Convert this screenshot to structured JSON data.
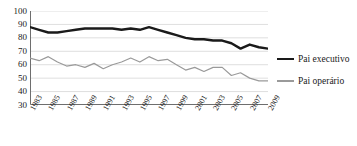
{
  "chart_data": {
    "type": "line",
    "title": "",
    "xlabel": "",
    "ylabel": "",
    "ylim": [
      30,
      100
    ],
    "ytick_values": [
      30,
      40,
      50,
      60,
      70,
      80,
      90,
      100
    ],
    "ytick_labels": [
      "30",
      "40",
      "50",
      "60",
      "70",
      "80",
      "90",
      "100"
    ],
    "grid": true,
    "grid_axis": "y",
    "legend_position": "right",
    "x": [
      1983,
      1984,
      1985,
      1986,
      1987,
      1988,
      1989,
      1990,
      1991,
      1992,
      1993,
      1994,
      1995,
      1996,
      1997,
      1998,
      1999,
      2000,
      2001,
      2002,
      2003,
      2004,
      2005,
      2006,
      2007,
      2008,
      2009
    ],
    "xtick_values": [
      1983,
      1985,
      1987,
      1989,
      1991,
      1993,
      1995,
      1997,
      1999,
      2001,
      2003,
      2005,
      2007,
      2009
    ],
    "xtick_labels": [
      "1983",
      "1985",
      "1987",
      "1989",
      "1991",
      "1993",
      "1995",
      "1997",
      "1999",
      "2001",
      "2003",
      "2005",
      "2007",
      "2009"
    ],
    "series": [
      {
        "name": "Pai executivo",
        "color": "#1a1a1a",
        "width": 2.4,
        "values": [
          88,
          86,
          84,
          84,
          85,
          86,
          87,
          87,
          87,
          87,
          86,
          87,
          86,
          88,
          86,
          84,
          82,
          80,
          79,
          79,
          78,
          78,
          76,
          72,
          75,
          73,
          72
        ]
      },
      {
        "name": "Pai operário",
        "color": "#9a9a9a",
        "width": 1.2,
        "values": [
          65,
          63,
          66,
          62,
          59,
          60,
          58,
          61,
          57,
          60,
          62,
          65,
          62,
          66,
          63,
          64,
          60,
          56,
          58,
          55,
          58,
          58,
          52,
          54,
          50,
          48,
          48
        ]
      }
    ]
  },
  "legend": {
    "items": [
      {
        "label": "Pai executivo"
      },
      {
        "label": "Pai operário"
      }
    ]
  }
}
